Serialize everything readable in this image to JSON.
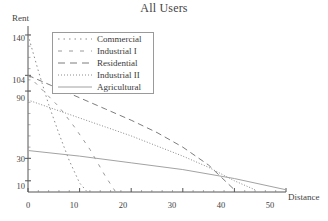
{
  "chart_data": {
    "type": "line",
    "title": "All Users",
    "xlabel": "Distance",
    "ylabel": "Rent",
    "xlim": [
      0,
      50
    ],
    "ylim": [
      0,
      148
    ],
    "xticks": [
      0,
      10,
      20,
      30,
      40,
      50
    ],
    "yticks": [
      10,
      30,
      90,
      104,
      140
    ],
    "grid": false,
    "legend_position": "upper-left-inside",
    "series": [
      {
        "name": "Commercial",
        "style": "dotted",
        "x": [
          0,
          2,
          4,
          6,
          8,
          10,
          11.5
        ],
        "y": [
          140,
          108,
          78,
          52,
          28,
          8,
          0
        ]
      },
      {
        "name": "Industrial I",
        "style": "dashed-long-gap",
        "x": [
          0,
          3,
          6,
          9,
          12,
          15,
          17
        ],
        "y": [
          104,
          90,
          76,
          58,
          38,
          14,
          0
        ]
      },
      {
        "name": "Residential",
        "style": "long-dash",
        "x": [
          0,
          5,
          10,
          15,
          20,
          25,
          30,
          35,
          40
        ],
        "y": [
          104,
          94,
          84,
          74,
          64,
          53,
          40,
          24,
          2
        ]
      },
      {
        "name": "Industrial II",
        "style": "fine-dotted",
        "x": [
          0,
          5,
          10,
          15,
          20,
          25,
          30,
          35,
          40,
          44
        ],
        "y": [
          82,
          74,
          66,
          58,
          50,
          41,
          32,
          22,
          10,
          2
        ]
      },
      {
        "name": "Agricultural",
        "style": "solid",
        "x": [
          0,
          10,
          20,
          30,
          40,
          50
        ],
        "y": [
          37,
          32,
          26,
          20,
          12,
          2
        ]
      }
    ]
  },
  "axis": {
    "y_tick_labels": [
      "140",
      "104",
      "90",
      "30",
      "10"
    ],
    "x_tick_labels": [
      "0",
      "10",
      "20",
      "30",
      "40",
      "50"
    ]
  },
  "legend": {
    "items": [
      {
        "label": "Commercial"
      },
      {
        "label": "Industrial I"
      },
      {
        "label": "Residential"
      },
      {
        "label": "Industrial II"
      },
      {
        "label": "Agricultural"
      }
    ]
  },
  "colors": {
    "axis": "#555555",
    "series": "#8c8c8c",
    "text": "#3a3a3a"
  }
}
